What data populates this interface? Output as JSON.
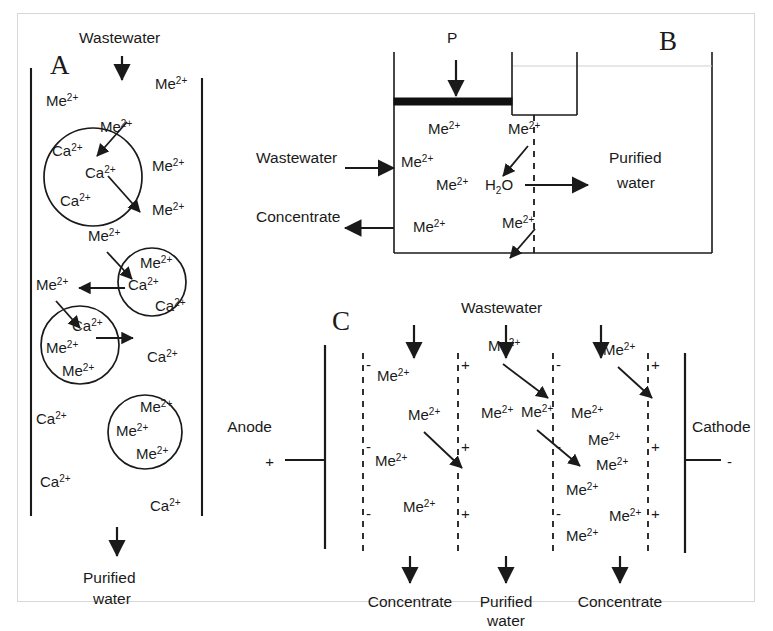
{
  "figure": {
    "panels": [
      "A",
      "B",
      "C"
    ],
    "ion_me": "Me",
    "ion_ca": "Ca",
    "charge": "2+"
  },
  "panelA": {
    "letter": "A",
    "inlet_label": "Wastewater",
    "outlet_label_line1": "Purified",
    "outlet_label_line2": "water",
    "free_ions": [
      {
        "sp": "Me",
        "x": 46,
        "y": 106
      },
      {
        "sp": "Me",
        "x": 155,
        "y": 89
      },
      {
        "sp": "Me",
        "x": 100,
        "y": 132
      },
      {
        "sp": "Me",
        "x": 152,
        "y": 171
      },
      {
        "sp": "Me",
        "x": 152,
        "y": 215
      },
      {
        "sp": "Me",
        "x": 88,
        "y": 241
      },
      {
        "sp": "Me",
        "x": 36,
        "y": 290
      },
      {
        "sp": "Ca",
        "x": 147,
        "y": 362
      },
      {
        "sp": "Ca",
        "x": 36,
        "y": 424
      },
      {
        "sp": "Ca",
        "x": 40,
        "y": 487
      },
      {
        "sp": "Ca",
        "x": 150,
        "y": 511
      }
    ],
    "particles": [
      {
        "cx": 93,
        "cy": 177,
        "r": 49,
        "ions": [
          {
            "sp": "Ca",
            "x": 52,
            "y": 156
          },
          {
            "sp": "Ca",
            "x": 85,
            "y": 178
          },
          {
            "sp": "Ca",
            "x": 60,
            "y": 206
          }
        ]
      },
      {
        "cx": 152,
        "cy": 282,
        "r": 34,
        "ions": [
          {
            "sp": "Me",
            "x": 140,
            "y": 268
          },
          {
            "sp": "Ca",
            "x": 128,
            "y": 290
          },
          {
            "sp": "Ca",
            "x": 155,
            "y": 311
          }
        ]
      },
      {
        "cx": 80,
        "cy": 345,
        "r": 39,
        "ions": [
          {
            "sp": "Ca",
            "x": 72,
            "y": 331
          },
          {
            "sp": "Me",
            "x": 46,
            "y": 353
          },
          {
            "sp": "Me",
            "x": 62,
            "y": 376
          }
        ]
      },
      {
        "cx": 145,
        "cy": 432,
        "r": 37,
        "ions": [
          {
            "sp": "Me",
            "x": 140,
            "y": 412
          },
          {
            "sp": "Me",
            "x": 116,
            "y": 436
          },
          {
            "sp": "Me",
            "x": 136,
            "y": 459
          }
        ]
      }
    ]
  },
  "panelB": {
    "letter": "B",
    "pressure_label": "P",
    "feed_label": "Wastewater",
    "reject_label": "Concentrate",
    "permeate_label_line1": "Purified",
    "permeate_label_line2": "water",
    "water_label": "H",
    "water_sub": "2",
    "water_label2": "O",
    "ions": [
      {
        "sp": "Me",
        "x": 428,
        "y": 134
      },
      {
        "sp": "Me",
        "x": 508,
        "y": 134
      },
      {
        "sp": "Me",
        "x": 401,
        "y": 167
      },
      {
        "sp": "Me",
        "x": 436,
        "y": 190
      },
      {
        "sp": "Me",
        "x": 413,
        "y": 232
      },
      {
        "sp": "Me",
        "x": 502,
        "y": 228
      }
    ]
  },
  "panelC": {
    "letter": "C",
    "feed_label": "Wastewater",
    "anode_label": "Anode",
    "anode_sign": "+",
    "cathode_label": "Cathode",
    "cathode_sign": "-",
    "outlets": [
      {
        "label": "Concentrate",
        "x": 382
      },
      {
        "label": "Purified",
        "label2": "water",
        "x": 500
      },
      {
        "label": "Concentrate",
        "x": 624
      }
    ],
    "membranes": [
      {
        "x": 363,
        "sign": "-"
      },
      {
        "x": 458,
        "sign": "+"
      },
      {
        "x": 553,
        "sign": "-"
      },
      {
        "x": 648,
        "sign": "+"
      }
    ],
    "ions": [
      {
        "sp": "Me",
        "x": 377,
        "y": 381
      },
      {
        "sp": "Me",
        "x": 408,
        "y": 420
      },
      {
        "sp": "Me",
        "x": 375,
        "y": 466
      },
      {
        "sp": "Me",
        "x": 403,
        "y": 512
      },
      {
        "sp": "Me",
        "x": 481,
        "y": 418
      },
      {
        "sp": "Me",
        "x": 488,
        "y": 351
      },
      {
        "sp": "Me",
        "x": 521,
        "y": 417
      },
      {
        "sp": "Me",
        "x": 571,
        "y": 418
      },
      {
        "sp": "Me",
        "x": 588,
        "y": 445
      },
      {
        "sp": "Me",
        "x": 566,
        "y": 495
      },
      {
        "sp": "Me",
        "x": 596,
        "y": 470
      },
      {
        "sp": "Me",
        "x": 609,
        "y": 521
      },
      {
        "sp": "Me",
        "x": 566,
        "y": 541
      },
      {
        "sp": "Me",
        "x": 603,
        "y": 355
      }
    ]
  }
}
